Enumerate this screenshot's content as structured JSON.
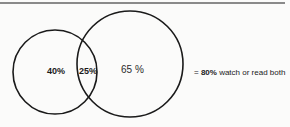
{
  "diagram": {
    "type": "venn",
    "sets": [
      {
        "name": "left-circle",
        "exclusive_label": "40%"
      },
      {
        "name": "right-circle",
        "exclusive_label": "65 %"
      }
    ],
    "intersection_label": "25%",
    "result": {
      "prefix": "= ",
      "value": "80%",
      "suffix": " watch or read both"
    },
    "colors": {
      "stroke": "#1a1a1a",
      "background": "#fbfbfa",
      "rule": "#8a8a8a"
    }
  }
}
